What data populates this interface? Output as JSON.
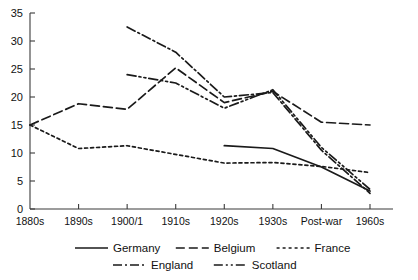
{
  "chart_data": {
    "type": "line",
    "title": "",
    "subtitle": "",
    "xlabel": "",
    "ylabel": "",
    "grid": false,
    "legend_position": "bottom",
    "x": [
      "1880s",
      "1890s",
      "1900/1",
      "1910s",
      "1920s",
      "1930s",
      "Post-war",
      "1960s"
    ],
    "xlim": [
      "1880s",
      "1960s"
    ],
    "ylim": [
      0,
      35
    ],
    "yticks": [
      0,
      5,
      10,
      15,
      20,
      25,
      30,
      35
    ],
    "ytick_labels": [
      "0",
      "5",
      "10",
      "15",
      "20",
      "25",
      "30",
      "35"
    ],
    "xtick_labels": [
      "1880s",
      "1890s",
      "1900/1",
      "1910s",
      "1920s",
      "1930s",
      "Post-war",
      "1960s"
    ],
    "series": [
      {
        "name": "Germany",
        "style": "solid",
        "x": [
          "1920s",
          "1930s",
          "Post-war",
          "1960s"
        ],
        "values": [
          11.3,
          10.8,
          7.5,
          3.2
        ]
      },
      {
        "name": "Belgium",
        "style": "dashed",
        "x": [
          "1880s",
          "1890s",
          "1900/1",
          "1910s",
          "1920s",
          "1930s",
          "Post-war",
          "1960s"
        ],
        "values": [
          15.0,
          18.8,
          17.8,
          25.2,
          19.0,
          21.0,
          15.5,
          15.0
        ]
      },
      {
        "name": "France",
        "style": "dotted",
        "x": [
          "1880s",
          "1890s",
          "1900/1",
          "1920s",
          "1930s",
          "Post-war",
          "1960s"
        ],
        "values": [
          15.0,
          10.8,
          11.3,
          8.2,
          8.3,
          7.6,
          6.5
        ]
      },
      {
        "name": "England",
        "style": "dash-dot",
        "x": [
          "1900/1",
          "1910s",
          "1920s",
          "1930s",
          "Post-war",
          "1960s"
        ],
        "values": [
          32.5,
          28.0,
          20.0,
          20.8,
          10.5,
          2.8
        ]
      },
      {
        "name": "Scotland",
        "style": "dash-dot-dot",
        "x": [
          "1900/1",
          "1910s",
          "1920s",
          "1930s",
          "Post-war",
          "1960s"
        ],
        "values": [
          24.0,
          22.5,
          18.0,
          21.3,
          11.0,
          3.5
        ]
      }
    ]
  },
  "axes": {
    "y_tick_labels": [
      "35",
      "30",
      "25",
      "20",
      "15",
      "10",
      "5",
      "0"
    ],
    "x_tick_labels": [
      "1880s",
      "1890s",
      "1900/1",
      "1910s",
      "1920s",
      "1930s",
      "Post-war",
      "1960s"
    ]
  },
  "legend": {
    "row1": [
      {
        "label": "Germany",
        "style": "solid"
      },
      {
        "label": "Belgium",
        "style": "dashed"
      },
      {
        "label": "France",
        "style": "dotted"
      }
    ],
    "row2": [
      {
        "label": "England",
        "style": "dash-dot"
      },
      {
        "label": "Scotland",
        "style": "dash-dot-dot"
      }
    ]
  },
  "colors": {
    "ink": "#1a1a1a",
    "axis": "#3b3b3b",
    "background": "#ffffff"
  }
}
